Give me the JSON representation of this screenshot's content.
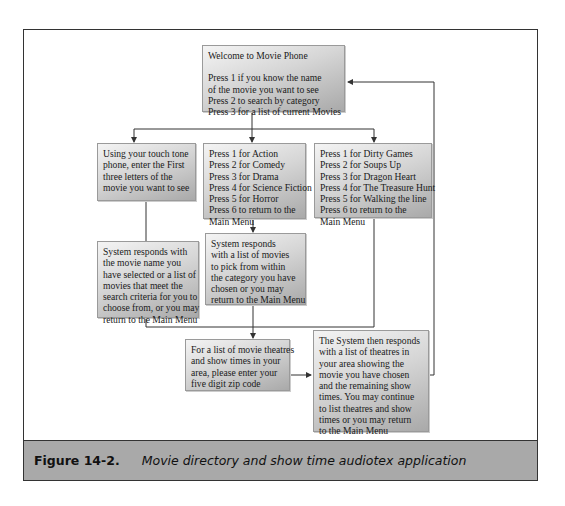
{
  "diagram": {
    "main_menu": {
      "title": "Welcome to Movie Phone",
      "lines": [
        "Press 1 if you know the name",
        "of the movie you want to see",
        "Press 2 to search by category",
        "Press 3 for a list of current Movies"
      ]
    },
    "enter_letters": {
      "lines": [
        "Using your touch tone",
        "phone, enter the First",
        "three letters of the",
        "movie you want to see"
      ]
    },
    "category_menu": {
      "lines": [
        "Press 1 for Action",
        "Press 2 for Comedy",
        "Press 3 for Drama",
        "Press 4 for Science Fiction",
        "Press 5 for Horror",
        "Press 6 to return to the",
        "Main Menu"
      ]
    },
    "current_movies_menu": {
      "lines": [
        "Press 1 for Dirty Games",
        "Press 2 for Soups Up",
        "Press 3 for Dragon Heart",
        "Press 4 for The Treasure Hunt",
        "Press 5 for Walking the line",
        "Press 6 to return to the",
        "Main Menu"
      ]
    },
    "name_search_result": {
      "lines": [
        "System responds with",
        "the movie name you",
        "have selected or a list of",
        "movies that meet the",
        "search criteria for you to",
        "choose from, or you may",
        "return to the Main Menu"
      ]
    },
    "category_result": {
      "lines": [
        "System responds",
        "with a list of movies",
        "to pick from within",
        "the category you have",
        "chosen or you may",
        "return to the Main Menu"
      ]
    },
    "zip_prompt": {
      "lines": [
        "For a list of movie theatres",
        "and show times in your",
        "area, please enter your",
        "five digit zip code"
      ]
    },
    "theatre_result": {
      "lines": [
        "The System then responds",
        "with a list of theatres in",
        "your area showing the",
        "movie you have chosen",
        "and the remaining show",
        "times.  You may continue",
        "to list theatres and show",
        "times or you may return",
        "to the Main Menu"
      ]
    }
  },
  "caption": {
    "number": "Figure 14-2.",
    "text": "Movie directory and show time audiotex application"
  },
  "colors": {
    "frame_border": "#333333",
    "caption_bg": "#a9a9a9",
    "box_gradient_light": "#f4f4f4",
    "box_gradient_dark": "#a9a9a9",
    "connector": "#333333"
  }
}
